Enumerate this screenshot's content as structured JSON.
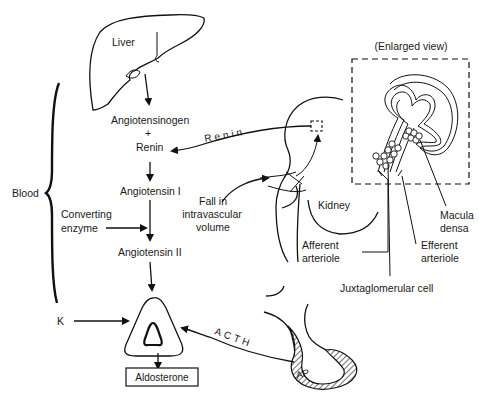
{
  "labels": {
    "liver": "Liver",
    "angiotensinogen": "Angiotensinogen",
    "plus": "+",
    "renin_substrate": "Renin",
    "angiotensin_1": "Angiotensin I",
    "angiotensin_2": "Angiotensin II",
    "converting_line1": "Converting",
    "converting_line2": "enzyme",
    "blood": "Blood",
    "k": "K",
    "aldosterone": "Aldosterone",
    "renin_arrow": "Renin",
    "acth_arrow": "ACTH",
    "fall_line1": "Fall in",
    "fall_line2": "intravascular",
    "fall_line3": "volume",
    "kidney": "Kidney",
    "enlarged_view": "(Enlarged view)",
    "macula_line1": "Macula",
    "macula_line2": "densa",
    "efferent_line1": "Efferent",
    "efferent_line2": "arteriole",
    "afferent_line1": "Afferent",
    "afferent_line2": "arteriole",
    "juxtaglomerular": "Juxtaglomerular cell",
    "ap": "AP"
  }
}
